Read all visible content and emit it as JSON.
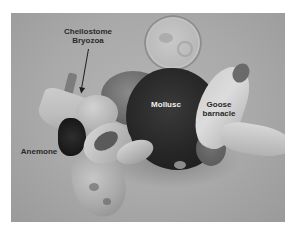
{
  "image": {
    "description": "Grayscale photograph of a mollusc encrusted with goose barnacles, anemone and cheilostome bryozoa, next to a coin for scale",
    "background_color": "#ffffff",
    "photo_tone": "#a9a9a9"
  },
  "labels": {
    "bryozoa_line1": "Cheilostome",
    "bryozoa_line2": "Bryozoa",
    "mollusc": "Mollusc",
    "goose_line1": "Goose",
    "goose_line2": "barnacle",
    "anemone": "Anemone"
  },
  "annotations": {
    "arrow": "points from Cheilostome Bryozoa label down to the bryozoa on shell"
  }
}
